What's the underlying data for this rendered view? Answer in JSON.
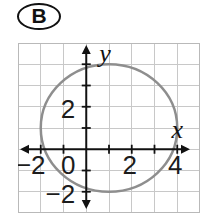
{
  "badge": {
    "label": "B"
  },
  "chart_data": {
    "type": "line",
    "title": "",
    "shape": {
      "kind": "circle",
      "center": [
        1,
        1
      ],
      "radius": 3,
      "equation": "(x-1)^2 + (y-1)^2 = 9",
      "x_intercepts_approx": [
        -1.83,
        3.83
      ],
      "y_intercepts_approx": [
        -1.83,
        3.83
      ]
    },
    "axes": {
      "xlabel": "x",
      "ylabel": "y",
      "xlim": [
        -3,
        5
      ],
      "ylim": [
        -3,
        5
      ],
      "tick_step": 1,
      "grid": true,
      "x_tick_labels": [
        {
          "value": -2,
          "label": "−2"
        },
        {
          "value": 2,
          "label": "2"
        },
        {
          "value": 4,
          "label": "4"
        }
      ],
      "y_tick_labels": [
        {
          "value": 2,
          "label": "2"
        },
        {
          "value": -2,
          "label": "−2"
        }
      ],
      "origin_label": "0"
    },
    "colors": {
      "grid": "#c8c8c8",
      "frame": "#b9b9b9",
      "axis": "#111111",
      "circle": "#8e8e8e",
      "text": "#1c1c1c"
    }
  }
}
